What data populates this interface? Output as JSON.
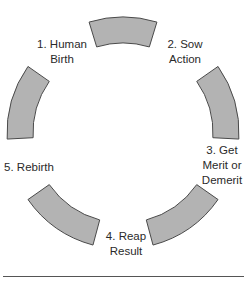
{
  "diagram": {
    "type": "cycle",
    "title": "",
    "center": {
      "x": 123,
      "y": 133
    },
    "inner_radius": 90,
    "outer_radius": 116,
    "segment_fill": "#b3b3b3",
    "segment_stroke": "#4a4a4a",
    "segments": [
      {
        "name": "segment-top",
        "start_deg": -17,
        "end_deg": 17
      },
      {
        "name": "segment-right-upper",
        "start_deg": 55,
        "end_deg": 93
      },
      {
        "name": "segment-right-lower",
        "start_deg": 125,
        "end_deg": 165
      },
      {
        "name": "segment-left-lower",
        "start_deg": 195,
        "end_deg": 235
      },
      {
        "name": "segment-left-upper",
        "start_deg": 267,
        "end_deg": 305
      }
    ],
    "steps": [
      {
        "label_line1": "1. Human",
        "label_line2": "Birth"
      },
      {
        "label_line1": "2. Sow",
        "label_line2": "Action"
      },
      {
        "label_line1": "3. Get",
        "label_line2": "Merit or",
        "label_line3": "Demerit"
      },
      {
        "label_line1": "4. Reap",
        "label_line2": "Result"
      },
      {
        "label_line1": "5. Rebirth"
      }
    ]
  }
}
